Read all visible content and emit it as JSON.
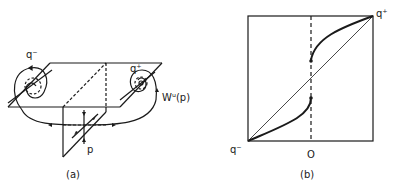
{
  "panels": [
    {
      "id": "a",
      "caption": "(a)",
      "labels": {
        "q_minus": "q⁻",
        "q_plus": "q⁺",
        "unstable_manifold": "Wᵘ(p)",
        "saddle_point": "p"
      }
    },
    {
      "id": "b",
      "caption": "(b)",
      "labels": {
        "bottom_left_corner": "q⁻",
        "top_right_corner": "q⁺",
        "axis_origin": "O"
      }
    }
  ],
  "colors": {
    "ink": "#1a1a1a",
    "background": "#ffffff"
  }
}
